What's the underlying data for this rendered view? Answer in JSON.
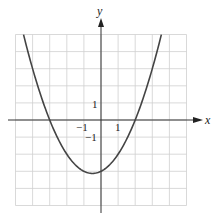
{
  "chart_data": {
    "type": "line",
    "title": "",
    "xlabel": "x",
    "ylabel": "y",
    "xlim": [
      -5,
      5
    ],
    "ylim": [
      -5,
      5
    ],
    "grid": true,
    "tick_labels": {
      "x": [
        "-1",
        "1"
      ],
      "y": [
        "1",
        "-1"
      ]
    },
    "series": [
      {
        "name": "parabola",
        "equation": "y = (x^2 + x - 6)/2",
        "x": [
          -4.53,
          -4,
          -3,
          -2,
          -1,
          -0.5,
          0,
          1,
          2,
          3,
          3.53
        ],
        "values": [
          5,
          3,
          0,
          -2,
          -3,
          -3.125,
          -3,
          -2,
          0,
          3,
          5
        ]
      }
    ],
    "key_points": {
      "x_intercepts": [
        -3,
        2
      ],
      "y_intercept": -3,
      "vertex": [
        -0.5,
        -3.125
      ]
    }
  },
  "labels": {
    "x_axis": "x",
    "y_axis": "y",
    "tick_x_neg1": "−1",
    "tick_x_pos1": "1",
    "tick_y_pos1": "1",
    "tick_y_neg1": "−1"
  },
  "colors": {
    "grid": "#cfcfcf",
    "axis": "#333333",
    "curve": "#444444"
  }
}
